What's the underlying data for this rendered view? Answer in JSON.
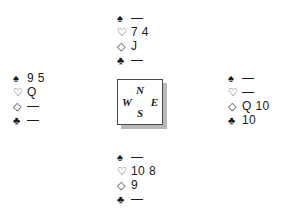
{
  "figure": {
    "type": "bridge-deal-diagram",
    "background_color": "#ffffff",
    "ink_color": "#1a1a1a"
  },
  "suit_symbols": {
    "spade": "♠",
    "heart": "♡",
    "diamond": "◇",
    "club": "♣"
  },
  "void": "—",
  "compass": {
    "north": "N",
    "west": "W",
    "east": "E",
    "south": "S"
  },
  "hands": {
    "north": {
      "label": "North",
      "spades": "—",
      "hearts": "7 4",
      "diamonds": "J",
      "clubs": "—"
    },
    "west": {
      "label": "West",
      "spades": "9 5",
      "hearts": "Q",
      "diamonds": "—",
      "clubs": "—"
    },
    "east": {
      "label": "East",
      "spades": "—",
      "hearts": "—",
      "diamonds": "Q 10",
      "clubs": "10"
    },
    "south": {
      "label": "South",
      "spades": "—",
      "hearts": "10 8",
      "diamonds": "9",
      "clubs": "—"
    }
  }
}
